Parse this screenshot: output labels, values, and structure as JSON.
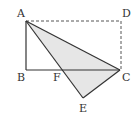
{
  "diagram": {
    "type": "geometry-figure",
    "colors": {
      "line": "#333333",
      "fill": "#e6e6e6",
      "dashed": "#555555"
    },
    "points": {
      "A": {
        "label": "A",
        "x": 26,
        "y": 21
      },
      "B": {
        "label": "B",
        "x": 26,
        "y": 70
      },
      "C": {
        "label": "C",
        "x": 120,
        "y": 70
      },
      "D": {
        "label": "D",
        "x": 121,
        "y": 21
      },
      "E": {
        "label": "E",
        "x": 83,
        "y": 98
      },
      "F": {
        "label": "F",
        "x": 62,
        "y": 70
      }
    },
    "segments": {
      "solid": [
        "AB",
        "BC",
        "AC",
        "AE",
        "EC"
      ],
      "dashed": [
        "AD",
        "DC"
      ]
    },
    "shaded_polygon": [
      "A",
      "C",
      "E"
    ]
  }
}
